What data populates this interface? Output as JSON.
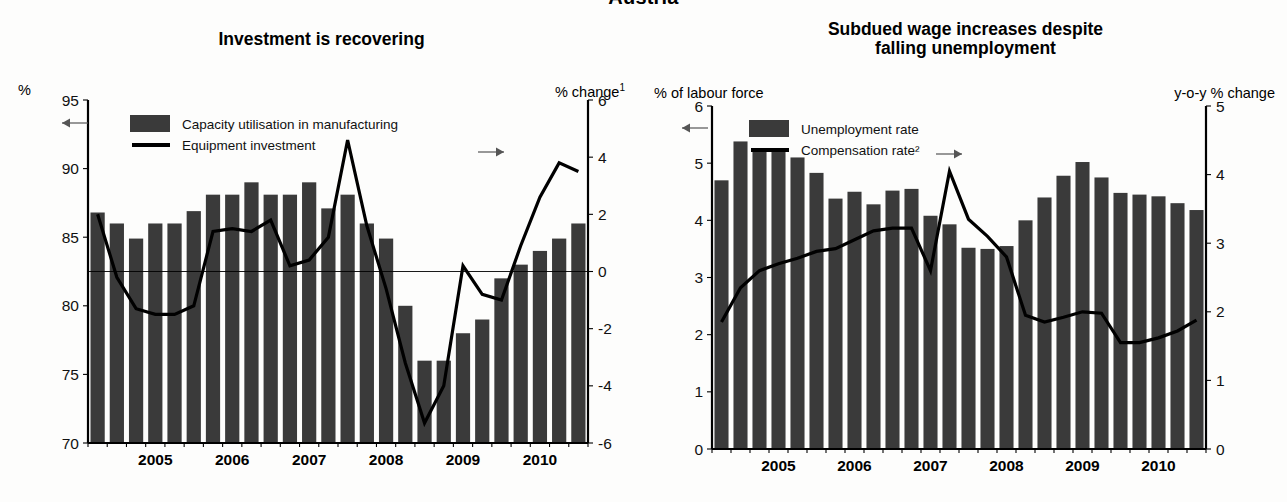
{
  "figure": {
    "suptitle": "Austria"
  },
  "panels": [
    {
      "id": "investment",
      "title": "Investment is recovering",
      "left_axis_caption": "%",
      "right_axis_caption": "% change¹",
      "left_arrow": "←",
      "right_arrow": "→",
      "legend": [
        {
          "label": "Capacity utilisation in manufacturing",
          "marker": "bar-swatch"
        },
        {
          "label": "Equipment investment",
          "marker": "line-swatch"
        }
      ]
    },
    {
      "id": "wages",
      "title_line1": "Subdued wage increases despite",
      "title_line2": "falling unemployment",
      "left_axis_caption": "% of labour force",
      "right_axis_caption": "y-o-y % change",
      "left_arrow": "←",
      "right_arrow": "→",
      "legend": [
        {
          "label": "Unemployment rate",
          "marker": "bar-swatch"
        },
        {
          "label": "Compensation rate²",
          "marker": "line-swatch"
        }
      ]
    }
  ],
  "chart_data": [
    {
      "type": "bar",
      "id": "investment",
      "title": "Investment is recovering",
      "xlabel": "",
      "ylabel": "%",
      "y2label": "% change¹",
      "ylim": [
        70,
        95
      ],
      "y2lim": [
        -6,
        6
      ],
      "yticks": [
        95,
        90,
        85,
        80,
        75,
        70
      ],
      "y2ticks": [
        6,
        4,
        2,
        0,
        -2,
        -4,
        -6
      ],
      "grid": false,
      "legend_position": "upper-left-inside",
      "x": [
        "2004Q3",
        "2004Q4",
        "2005Q1",
        "2005Q2",
        "2005Q3",
        "2005Q4",
        "2006Q1",
        "2006Q2",
        "2006Q3",
        "2006Q4",
        "2007Q1",
        "2007Q2",
        "2007Q3",
        "2007Q4",
        "2008Q1",
        "2008Q2",
        "2008Q3",
        "2008Q4",
        "2009Q1",
        "2009Q2",
        "2009Q3",
        "2009Q4",
        "2010Q1",
        "2010Q2",
        "2010Q3",
        "2010Q4"
      ],
      "xtick_labels": [
        "2005",
        "2006",
        "2007",
        "2008",
        "2009",
        "2010"
      ],
      "xtick_positions": [
        3.0,
        7.0,
        11.0,
        15.0,
        19.0,
        23.0
      ],
      "series": [
        {
          "name": "Capacity utilisation in manufacturing",
          "axis": "left",
          "kind": "bar",
          "units": "%",
          "values": [
            86.8,
            86.0,
            84.9,
            86.0,
            86.0,
            86.9,
            88.1,
            88.1,
            89.0,
            88.1,
            88.1,
            89.0,
            87.1,
            88.1,
            86.0,
            84.9,
            80.0,
            76.0,
            76.0,
            78.0,
            79.0,
            82.0,
            83.0,
            84.0,
            84.9,
            86.0
          ]
        },
        {
          "name": "Equipment investment",
          "axis": "right",
          "kind": "line",
          "units": "% change",
          "values": [
            2.0,
            -0.2,
            -1.3,
            -1.5,
            -1.5,
            -1.2,
            1.4,
            1.5,
            1.4,
            1.8,
            0.2,
            0.4,
            1.2,
            4.6,
            1.6,
            -0.6,
            -3.2,
            -5.3,
            -4.0,
            0.2,
            -0.8,
            -1.0,
            0.9,
            2.6,
            3.8,
            3.5
          ]
        }
      ]
    },
    {
      "type": "bar",
      "id": "wages",
      "title": "Subdued wage increases despite falling unemployment",
      "xlabel": "",
      "ylabel": "% of labour force",
      "y2label": "y-o-y % change",
      "ylim": [
        0,
        6
      ],
      "y2lim": [
        0,
        5
      ],
      "yticks": [
        6,
        5,
        4,
        3,
        2,
        1,
        0
      ],
      "y2ticks": [
        5,
        4,
        3,
        2,
        1,
        0
      ],
      "grid": false,
      "legend_position": "upper-left-inside",
      "x": [
        "2004Q3",
        "2004Q4",
        "2005Q1",
        "2005Q2",
        "2005Q3",
        "2005Q4",
        "2006Q1",
        "2006Q2",
        "2006Q3",
        "2006Q4",
        "2007Q1",
        "2007Q2",
        "2007Q3",
        "2007Q4",
        "2008Q1",
        "2008Q2",
        "2008Q3",
        "2008Q4",
        "2009Q1",
        "2009Q2",
        "2009Q3",
        "2009Q4",
        "2010Q1",
        "2010Q2",
        "2010Q3",
        "2010Q4"
      ],
      "xtick_labels": [
        "2005",
        "2006",
        "2007",
        "2008",
        "2009",
        "2010"
      ],
      "xtick_positions": [
        3.0,
        7.0,
        11.0,
        15.0,
        19.0,
        23.0
      ],
      "series": [
        {
          "name": "Unemployment rate",
          "axis": "left",
          "kind": "bar",
          "units": "% of labour force",
          "values": [
            4.7,
            5.38,
            5.22,
            5.2,
            5.1,
            4.83,
            4.38,
            4.5,
            4.28,
            4.52,
            4.55,
            4.08,
            3.93,
            3.52,
            3.5,
            3.55,
            4.0,
            4.4,
            4.78,
            5.02,
            4.75,
            4.48,
            4.45,
            4.42,
            4.3,
            4.18
          ]
        },
        {
          "name": "Compensation rate²",
          "axis": "right",
          "kind": "line",
          "units": "y-o-y % change",
          "values": [
            1.85,
            2.35,
            2.6,
            2.7,
            2.78,
            2.88,
            2.92,
            3.05,
            3.18,
            3.22,
            3.22,
            2.6,
            4.05,
            3.35,
            3.1,
            2.8,
            1.95,
            1.85,
            1.92,
            2.0,
            1.98,
            1.55,
            1.55,
            1.62,
            1.72,
            1.88
          ]
        }
      ]
    }
  ]
}
